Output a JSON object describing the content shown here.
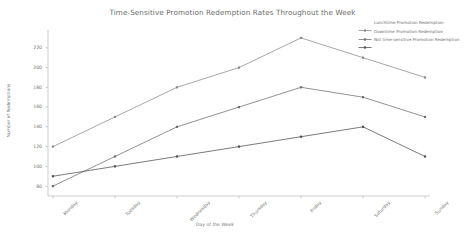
{
  "chart_data": {
    "type": "line",
    "title": "Time-Sensitive Promotion Redemption Rates Throughout the Week",
    "xlabel": "Day of the Week",
    "ylabel": "Number of Redemptions",
    "categories": [
      "Monday",
      "Tuesday",
      "Wednesday",
      "Thursday",
      "Friday",
      "Saturday",
      "Sunday"
    ],
    "yticks": [
      80,
      100,
      120,
      140,
      160,
      180,
      200,
      220
    ],
    "ylim": [
      70,
      238
    ],
    "grid": false,
    "legend_position": "top-right",
    "series": [
      {
        "name": "Lunchtime Promotion Redemption",
        "values": [
          120,
          150,
          180,
          200,
          230,
          210,
          190
        ],
        "color": "#8a8a8a",
        "marker": "square"
      },
      {
        "name": "Downtime Promotion Redemption",
        "values": [
          80,
          110,
          140,
          160,
          180,
          170,
          150
        ],
        "color": "#6e6e6e",
        "marker": "square"
      },
      {
        "name": "Not time-sensitive Promotion Redemption",
        "values": [
          90,
          100,
          110,
          120,
          130,
          140,
          110
        ],
        "color": "#4f4f4f",
        "marker": "square"
      }
    ]
  }
}
